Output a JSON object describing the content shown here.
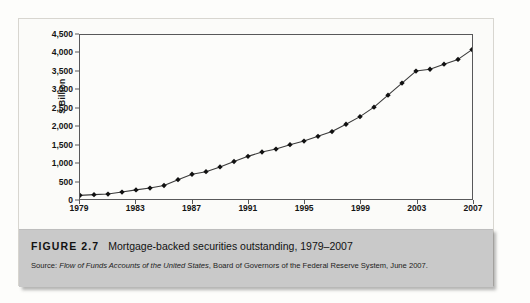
{
  "figure": {
    "label": "FIGURE 2.7",
    "title": "Mortgage-backed securities outstanding, 1979–2007",
    "source_prefix": "Source: ",
    "source_italic": "Flow of Funds Accounts of the United States",
    "source_rest": ", Board of Governors of the Federal Reserve System, June 2007."
  },
  "colors": {
    "page_background": "#fdfdfb",
    "panel_background": "#fbfbf9",
    "plot_background": "#fcfcfa",
    "axis_line": "#58585a",
    "series_line": "#3a3a3a",
    "marker_fill": "#111111",
    "caption_background": "#c9c9c9",
    "caption_text": "#121212"
  },
  "chart_data": {
    "type": "line",
    "title": "Mortgage-backed securities outstanding, 1979–2007",
    "xlabel": "",
    "ylabel": "$ Billion",
    "xlim": [
      1979,
      2007
    ],
    "ylim": [
      0,
      4500
    ],
    "grid": false,
    "legend": false,
    "marker": "diamond",
    "y_ticks": [
      0,
      500,
      1000,
      1500,
      2000,
      2500,
      3000,
      3500,
      4000,
      4500
    ],
    "y_tick_labels": [
      "0",
      "500",
      "1,000",
      "1,500",
      "2,000",
      "2,500",
      "3,000",
      "3,500",
      "4,000",
      "4,500"
    ],
    "x_ticks": [
      1979,
      1983,
      1987,
      1991,
      1995,
      1999,
      2003,
      2007
    ],
    "x_tick_labels": [
      "1979",
      "1983",
      "1987",
      "1991",
      "1995",
      "1999",
      "2003",
      "2007"
    ],
    "x": [
      1979,
      1980,
      1981,
      1982,
      1983,
      1984,
      1985,
      1986,
      1987,
      1988,
      1989,
      1990,
      1991,
      1992,
      1993,
      1994,
      1995,
      1996,
      1997,
      1998,
      1999,
      2000,
      2001,
      2002,
      2003,
      2004,
      2005,
      2006,
      2007
    ],
    "series": [
      {
        "name": "Mortgage-backed securities outstanding",
        "values": [
          100,
          120,
          135,
          190,
          250,
          300,
          370,
          530,
          680,
          750,
          880,
          1030,
          1170,
          1290,
          1370,
          1490,
          1590,
          1720,
          1850,
          2050,
          2260,
          2520,
          2850,
          3180,
          3510,
          3560,
          3700,
          3830,
          4100
        ]
      }
    ]
  }
}
